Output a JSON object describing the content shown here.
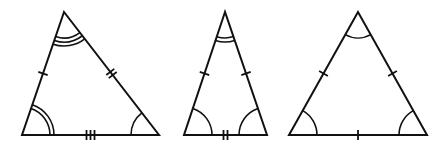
{
  "diagram": {
    "stroke_color": "#111111",
    "background": "#ffffff",
    "triangles": [
      {
        "name": "scalene",
        "vertices": {
          "top": [
            64,
            12
          ],
          "left": [
            22,
            135
          ],
          "right": [
            159,
            135
          ]
        },
        "side_ticks": {
          "left": 1,
          "right": 2,
          "base": 3
        },
        "angle_arcs": {
          "top": 3,
          "left": 2,
          "right": 1
        }
      },
      {
        "name": "isosceles",
        "vertices": {
          "top": [
            225,
            12
          ],
          "left": [
            184,
            135
          ],
          "right": [
            267,
            135
          ]
        },
        "side_ticks": {
          "left": 1,
          "right": 1,
          "base": 2
        },
        "angle_arcs": {
          "top": 2,
          "left": 1,
          "right": 1
        }
      },
      {
        "name": "equilateral",
        "vertices": {
          "top": [
            358,
            12
          ],
          "left": [
            289,
            135
          ],
          "right": [
            427,
            135
          ]
        },
        "side_ticks": {
          "left": 1,
          "right": 1,
          "base": 1
        },
        "angle_arcs": {
          "top": 1,
          "left": 1,
          "right": 1
        }
      }
    ]
  }
}
